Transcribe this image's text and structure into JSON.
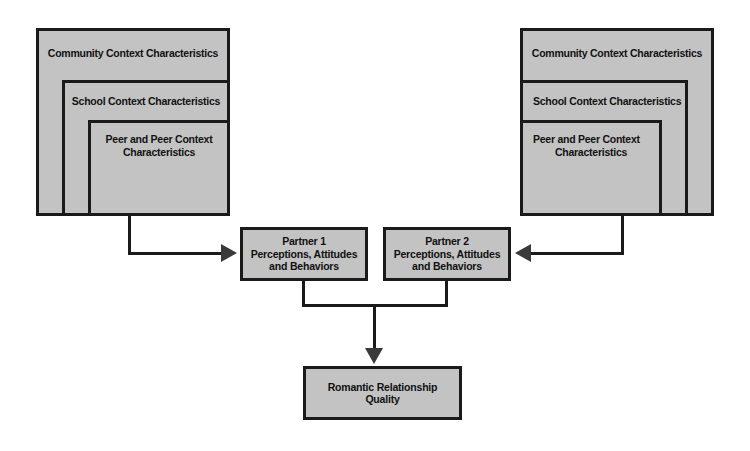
{
  "diagram": {
    "background_color": "#ffffff",
    "box_fill_color": "#c3c3c3",
    "box_border_color": "#1a1a1a",
    "arrow_color": "#3a3a3a"
  },
  "left_group": {
    "community_label": "Community Context Characteristics",
    "school_label": "School Context Characteristics",
    "peer_label_line1": "Peer and Peer Context",
    "peer_label_line2": "Characteristics"
  },
  "right_group": {
    "community_label": "Community Context Characteristics",
    "school_label": "School Context Characteristics",
    "peer_label_line1": "Peer and Peer Context",
    "peer_label_line2": "Characteristics"
  },
  "partner1": {
    "line1": "Partner 1",
    "line2": "Perceptions, Attitudes",
    "line3": "and Behaviors"
  },
  "partner2": {
    "line1": "Partner 2",
    "line2": "Perceptions, Attitudes",
    "line3": "and Behaviors"
  },
  "outcome": {
    "line1": "Romantic Relationship",
    "line2": "Quality"
  }
}
